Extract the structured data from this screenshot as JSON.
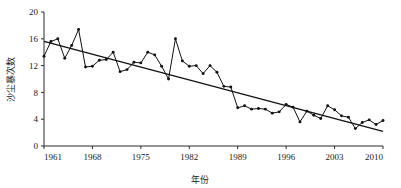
{
  "chart_data": {
    "type": "line",
    "title": "",
    "xlabel": "年份",
    "ylabel": "沙尘暴次数",
    "xlim": [
      1961,
      2010
    ],
    "ylim": [
      0,
      20
    ],
    "grid": false,
    "legend": false,
    "x_ticks": [
      "1961",
      "1968",
      "1975",
      "1982",
      "1989",
      "1996",
      "2003",
      "2010"
    ],
    "x_tick_values": [
      1961,
      1968,
      1975,
      1982,
      1989,
      1996,
      2003,
      2010
    ],
    "y_ticks": [
      "0",
      "4",
      "8",
      "12",
      "16",
      "20"
    ],
    "y_tick_values": [
      0,
      4,
      8,
      12,
      16,
      20
    ],
    "x": [
      1961,
      1962,
      1963,
      1964,
      1965,
      1966,
      1967,
      1968,
      1969,
      1970,
      1971,
      1972,
      1973,
      1974,
      1975,
      1976,
      1977,
      1978,
      1979,
      1980,
      1981,
      1982,
      1983,
      1984,
      1985,
      1986,
      1987,
      1988,
      1989,
      1990,
      1991,
      1992,
      1993,
      1994,
      1995,
      1996,
      1997,
      1998,
      1999,
      2000,
      2001,
      2002,
      2003,
      2004,
      2005,
      2006,
      2007,
      2008,
      2009,
      2010
    ],
    "series": [
      {
        "name": "沙尘暴次数",
        "marker": "filled-circle",
        "values": [
          13.4,
          15.6,
          16.0,
          13.1,
          15.0,
          17.4,
          11.8,
          11.9,
          12.8,
          12.9,
          14.0,
          11.1,
          11.4,
          12.5,
          12.4,
          14.0,
          13.6,
          11.9,
          10.0,
          16.0,
          12.7,
          11.9,
          12.0,
          10.8,
          12.0,
          11.0,
          8.9,
          8.8,
          5.7,
          6.0,
          5.5,
          5.6,
          5.5,
          4.9,
          5.1,
          6.2,
          5.8,
          3.6,
          5.2,
          4.6,
          4.1,
          6.0,
          5.4,
          4.5,
          4.3,
          2.6,
          3.5,
          3.9,
          3.2,
          3.8
        ]
      },
      {
        "name": "线性趋势线",
        "type": "trend",
        "start_value": 15.6,
        "end_value": 2.2
      }
    ]
  },
  "colors": {
    "series": "#111111",
    "trend": "#111111",
    "axis": "#2b2b2b",
    "background": "#ffffff"
  }
}
